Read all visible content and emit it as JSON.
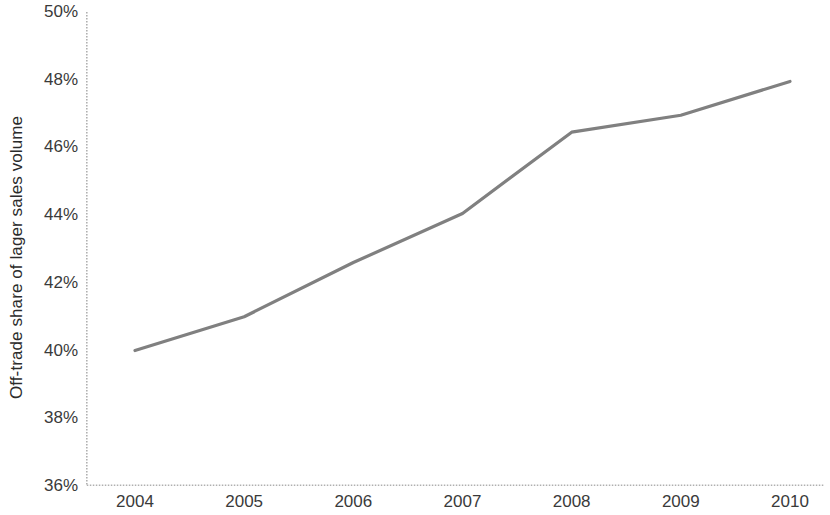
{
  "chart_data": {
    "type": "line",
    "title": "",
    "subtitle": "",
    "xlabel": "",
    "ylabel": "Off-trade share of lager sales volume",
    "categories": [
      "2004",
      "2005",
      "2006",
      "2007",
      "2008",
      "2009",
      "2010"
    ],
    "x": [
      2004,
      2005,
      2006,
      2007,
      2008,
      2009,
      2010
    ],
    "series": [
      {
        "name": "Off-trade share of lager sales volume",
        "values": [
          40.0,
          41.0,
          42.6,
          44.05,
          46.45,
          46.95,
          47.95
        ],
        "color": "#808080"
      }
    ],
    "values": [
      40.0,
      41.0,
      42.6,
      44.05,
      46.45,
      46.95,
      47.95
    ],
    "ylim": [
      36,
      50
    ],
    "ytick_values": [
      36,
      38,
      40,
      42,
      44,
      46,
      48,
      50
    ],
    "ytick_labels": [
      "36%",
      "38%",
      "40%",
      "42%",
      "44%",
      "46%",
      "48%",
      "50%"
    ],
    "xtick_labels": [
      "2004",
      "2005",
      "2006",
      "2007",
      "2008",
      "2009",
      "2010"
    ],
    "grid": false,
    "legend": "none",
    "axis_color": "#b0b0b0",
    "line_color": "#808080",
    "background_color": "#ffffff",
    "units": "percent"
  }
}
